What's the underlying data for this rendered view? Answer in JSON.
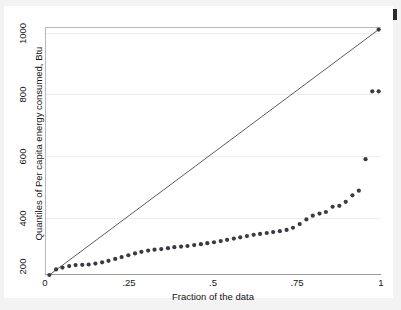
{
  "chart_data": {
    "type": "scatter",
    "title": "",
    "subtitle": "",
    "xlabel": "Fraction of the data",
    "ylabel": "Quantiles of Per capita energy consumed, Btu",
    "xlim": [
      0,
      1
    ],
    "ylim": [
      200,
      1000
    ],
    "xticks": [
      0,
      0.25,
      0.5,
      0.75,
      1
    ],
    "xticklabels": [
      "0",
      ".25",
      ".5",
      ".75",
      "1"
    ],
    "yticks": [
      200,
      400,
      600,
      800,
      1000
    ],
    "yticklabels": [
      "200",
      "400",
      "600",
      "800",
      "1000"
    ],
    "grid": "horizontal",
    "legend": "none",
    "series": [
      {
        "name": "Quantiles",
        "marker": "filled-circle",
        "color": "#3a3a42",
        "x": [
          0.01,
          0.03,
          0.049,
          0.069,
          0.088,
          0.108,
          0.127,
          0.147,
          0.167,
          0.186,
          0.206,
          0.225,
          0.245,
          0.265,
          0.284,
          0.304,
          0.323,
          0.343,
          0.363,
          0.382,
          0.402,
          0.421,
          0.441,
          0.461,
          0.48,
          0.5,
          0.52,
          0.539,
          0.559,
          0.578,
          0.598,
          0.618,
          0.637,
          0.657,
          0.676,
          0.696,
          0.716,
          0.735,
          0.755,
          0.775,
          0.794,
          0.814,
          0.833,
          0.853,
          0.873,
          0.892,
          0.912,
          0.931,
          0.951,
          0.971,
          0.99
        ],
        "y": [
          200,
          218,
          224,
          229,
          232,
          233,
          234,
          237,
          241,
          246,
          252,
          258,
          264,
          270,
          275,
          279,
          282,
          284,
          287,
          290,
          292,
          294,
          297,
          300,
          303,
          306,
          310,
          314,
          318,
          322,
          326,
          330,
          333,
          336,
          339,
          342,
          346,
          353,
          365,
          380,
          392,
          399,
          404,
          421,
          424,
          437,
          458,
          473,
          575,
          795,
          795
        ],
        "note": "right-skewed distribution; upper tail outliers at ~575 and ~795"
      },
      {
        "name": "Reference line",
        "marker": "none",
        "type": "line",
        "color": "#4a4a52",
        "x": [
          0.01,
          0.99
        ],
        "y": [
          200,
          995
        ]
      }
    ],
    "top_point": {
      "x": 0.99,
      "y": 995
    }
  },
  "axes": {
    "x_title": "Fraction of the data",
    "y_title": "Quantiles of Per capita energy consumed, Btu"
  },
  "ticks": {
    "x": [
      "0",
      ".25",
      ".5",
      ".75",
      "1"
    ],
    "y": [
      "200",
      "400",
      "600",
      "800",
      "1000"
    ]
  }
}
